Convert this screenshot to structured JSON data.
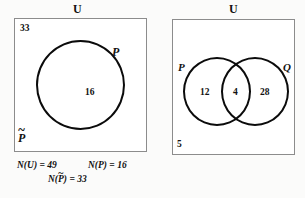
{
  "figure": {
    "type": "venn-diagram-pair",
    "background_color": "#fbfbfa",
    "stroke_color": "#0b0b0b",
    "box_border_color": "#8c8c8c"
  },
  "diagram_left": {
    "universe_label": "U",
    "outside_count": "33",
    "set_label": "P",
    "set_count": "16",
    "complement_base": "P",
    "complement_accent": "~",
    "caption": {
      "n_universe": "N(U) = 49",
      "n_p": "N(P) = 16",
      "n_p_complement_prefix": "N(",
      "n_p_complement_base": "P",
      "n_p_complement_accent": "~",
      "n_p_complement_suffix": ") = 33"
    }
  },
  "diagram_right": {
    "universe_label": "U",
    "set_label_left": "P",
    "set_label_right": "Q",
    "count_p_only": "12",
    "count_intersection": "4",
    "count_q_only": "28",
    "count_outside": "5"
  },
  "chart_data": {
    "type": "table",
    "diagrams": [
      {
        "name": "left",
        "universe_total": 49,
        "regions": [
          {
            "region": "P",
            "value": 16
          },
          {
            "region": "P-complement",
            "value": 33
          }
        ]
      },
      {
        "name": "right",
        "regions": [
          {
            "region": "P only",
            "value": 12
          },
          {
            "region": "P and Q",
            "value": 4
          },
          {
            "region": "Q only",
            "value": 28
          },
          {
            "region": "outside P and Q",
            "value": 5
          }
        ]
      }
    ]
  }
}
